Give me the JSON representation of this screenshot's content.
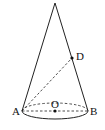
{
  "diagram": {
    "type": "cone",
    "labels": {
      "apex": "",
      "A": "A",
      "B": "B",
      "O": "O",
      "D": "D"
    },
    "colors": {
      "stroke": "#222222",
      "background": "#ffffff"
    }
  }
}
